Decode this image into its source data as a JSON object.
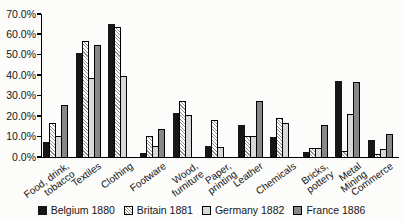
{
  "page": {
    "background_color": "#fcfcfa"
  },
  "chart_data": {
    "type": "bar",
    "title": "",
    "xlabel": "",
    "ylabel": "",
    "categories": [
      "Food, drink,\ntobacco",
      "Textiles",
      "Clothing",
      "Footware",
      "Wood,\nfurniture",
      "Paper,\nprinting",
      "Leather",
      "Chemicals",
      "Bricks,\npottery",
      "Metal\nMining",
      "Commerce"
    ],
    "series": [
      {
        "name": "Belgium 1880",
        "fill": "black",
        "color": "#161616",
        "values": [
          7.5,
          51,
          65,
          2,
          21.5,
          5.5,
          15.5,
          10,
          2.5,
          37,
          8.5
        ]
      },
      {
        "name": "Britain 1881",
        "fill": "hatch",
        "color": "#ffffff",
        "hatch_color": "#8f8f8f",
        "values": [
          16.5,
          57,
          63.5,
          10.5,
          27.5,
          18,
          10.5,
          19,
          4.5,
          3,
          1.5
        ]
      },
      {
        "name": "Germany 1882",
        "fill": "lightgray",
        "color": "#d8d8d5",
        "values": [
          10.5,
          38.5,
          39.5,
          5.5,
          20.5,
          5,
          10.5,
          16.5,
          4.5,
          21,
          4
        ]
      },
      {
        "name": "France 1886",
        "fill": "darkgray",
        "color": "#87878a",
        "values": [
          25.5,
          55,
          0,
          13.5,
          0,
          0,
          27.5,
          0,
          15.5,
          36.5,
          11.5
        ]
      }
    ],
    "ylim": [
      0,
      70
    ],
    "ytick_step": 10,
    "ytick_labels": [
      "0.0%",
      "10.0%",
      "20.0%",
      "30.0%",
      "40.0%",
      "50.0%",
      "60.0%",
      "70.0%"
    ],
    "grid": false,
    "legend_position": "bottom",
    "bar_border_color": "#000000"
  }
}
